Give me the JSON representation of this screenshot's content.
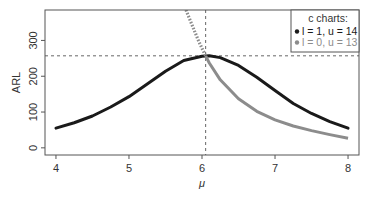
{
  "chart_data": {
    "type": "line",
    "title": "",
    "xlabel": "μ",
    "ylabel": "ARL",
    "xlim": [
      3.85,
      8.15
    ],
    "ylim": [
      -20,
      385
    ],
    "xticks": [
      4,
      5,
      6,
      7,
      8
    ],
    "xtick_labels": [
      "4",
      "5",
      "6",
      "7",
      "8"
    ],
    "yticks": [
      0,
      100,
      200,
      300
    ],
    "ytick_labels": [
      "0",
      "100",
      "200",
      "300"
    ],
    "grid": false,
    "reference_lines": {
      "vertical_x": 6.05,
      "horizontal_y": 257
    },
    "legend": {
      "title": "c charts:",
      "position": "top-right",
      "entries": [
        "l = 1, u = 14",
        "l = 0, u = 13"
      ]
    },
    "series": [
      {
        "name": "l = 1, u = 14",
        "color": "#1a1a1a",
        "x": [
          4.0,
          4.25,
          4.5,
          4.75,
          5.0,
          5.25,
          5.5,
          5.75,
          6.0,
          6.1,
          6.25,
          6.5,
          6.75,
          7.0,
          7.25,
          7.5,
          7.75,
          8.0
        ],
        "y": [
          55,
          70,
          89,
          114,
          143,
          178,
          214,
          244,
          256,
          257,
          252,
          230,
          197,
          160,
          124,
          96,
          73,
          55
        ]
      },
      {
        "name": "l = 0, u = 13",
        "color": "#8c8c8c",
        "dotted_until_x": 6.05,
        "x": [
          5.78,
          5.85,
          5.9,
          5.95,
          6.0,
          6.05,
          6.1,
          6.25,
          6.5,
          6.75,
          7.0,
          7.25,
          7.5,
          7.75,
          8.0
        ],
        "y": [
          385,
          350,
          325,
          300,
          278,
          257,
          237,
          190,
          137,
          102,
          78,
          61,
          48,
          37,
          27
        ]
      }
    ]
  }
}
